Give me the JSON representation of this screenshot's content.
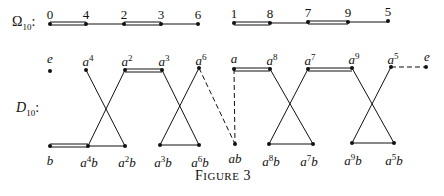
{
  "omega_row": {
    "label_main": "Ω",
    "label_sub": "10",
    "label_colon": ":",
    "group1": [
      {
        "label": "0",
        "x": 50
      },
      {
        "label": "4",
        "x": 86
      },
      {
        "label": "2",
        "x": 124
      },
      {
        "label": "3",
        "x": 161
      },
      {
        "label": "6",
        "x": 198
      }
    ],
    "group2": [
      {
        "label": "1",
        "x": 234
      },
      {
        "label": "8",
        "x": 270
      },
      {
        "label": "7",
        "x": 308
      },
      {
        "label": "9",
        "x": 348
      },
      {
        "label": "5",
        "x": 388
      }
    ]
  },
  "dihedral": {
    "label_main": "D",
    "label_sub": "10",
    "label_colon": ":",
    "top": [
      {
        "base": "e",
        "exp": "",
        "x": 50
      },
      {
        "base": "a",
        "exp": "4",
        "x": 86
      },
      {
        "base": "a",
        "exp": "2",
        "x": 125
      },
      {
        "base": "a",
        "exp": "3",
        "x": 162
      },
      {
        "base": "a",
        "exp": "6",
        "x": 199
      },
      {
        "base": "a",
        "exp": "",
        "x": 234
      },
      {
        "base": "a",
        "exp": "8",
        "x": 270
      },
      {
        "base": "a",
        "exp": "7",
        "x": 308
      },
      {
        "base": "a",
        "exp": "9",
        "x": 352
      },
      {
        "base": "a",
        "exp": "5",
        "x": 391
      },
      {
        "base": "e",
        "exp": "",
        "x": 426
      }
    ],
    "bottom": [
      {
        "base": "b",
        "exp": "",
        "suffix": "",
        "x": 50
      },
      {
        "base": "a",
        "exp": "4",
        "suffix": "b",
        "x": 88
      },
      {
        "base": "a",
        "exp": "2",
        "suffix": "b",
        "x": 125
      },
      {
        "base": "a",
        "exp": "3",
        "suffix": "b",
        "x": 160
      },
      {
        "base": "a",
        "exp": "6",
        "suffix": "b",
        "x": 199
      },
      {
        "base": "ab",
        "exp": "",
        "suffix": "",
        "x": 235
      },
      {
        "base": "a",
        "exp": "8",
        "suffix": "b",
        "x": 269
      },
      {
        "base": "a",
        "exp": "7",
        "suffix": "b",
        "x": 313
      },
      {
        "base": "a",
        "exp": "9",
        "suffix": "b",
        "x": 352
      },
      {
        "base": "a",
        "exp": "5",
        "suffix": "b",
        "x": 394
      }
    ]
  },
  "caption": {
    "first": "F",
    "rest": "IGURE",
    "number": "3"
  }
}
